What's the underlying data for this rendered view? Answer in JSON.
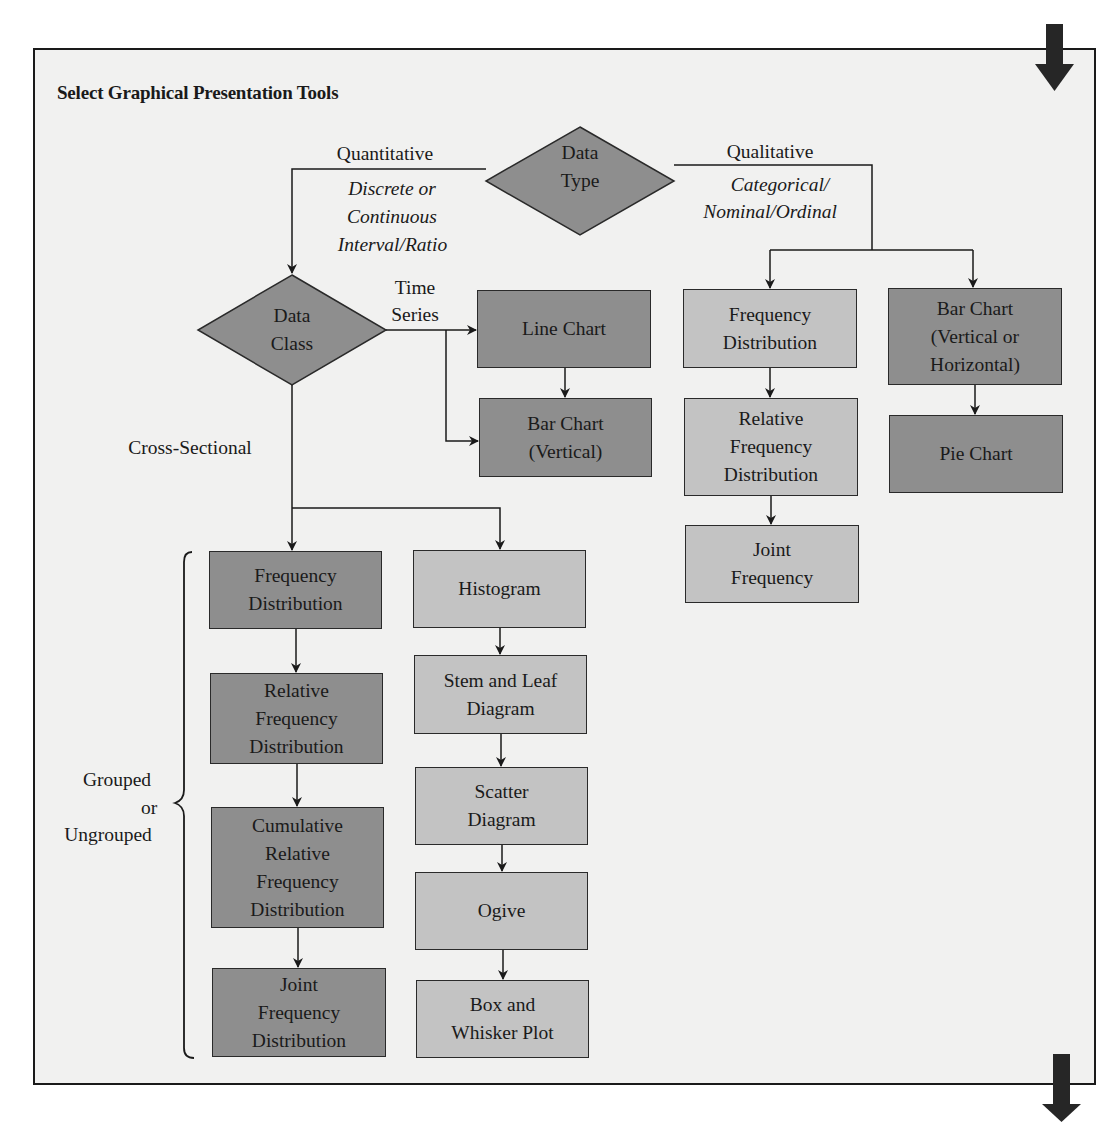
{
  "title": "Select Graphical Presentation Tools",
  "colors": {
    "frame_background": "#f1f1f0",
    "dark_box": "#8e8e8e",
    "light_box": "#c3c3c3",
    "diamond": "#8e8e8e",
    "lines": "#1a1a1a"
  },
  "decisions": {
    "data_type": "Data\nType",
    "data_class": "Data\nClass"
  },
  "branch_labels": {
    "quantitative": "Quantitative",
    "quantitative_desc_1": "Discrete or",
    "quantitative_desc_2": "Continuous",
    "quantitative_desc_3": "Interval/Ratio",
    "qualitative": "Qualitative",
    "qualitative_desc_1": "Categorical/",
    "qualitative_desc_2": "Nominal/Ordinal",
    "time_series_1": "Time",
    "time_series_2": "Series",
    "cross_sectional": "Cross-Sectional",
    "grouped_1": "Grouped",
    "grouped_2": "or",
    "grouped_3": "Ungrouped"
  },
  "time_series_tools": [
    {
      "label": "Line Chart",
      "shade": "dark"
    },
    {
      "label": "Bar Chart\n(Vertical)",
      "shade": "dark"
    }
  ],
  "qualitative_tools_left": [
    {
      "label": "Frequency\nDistribution",
      "shade": "light"
    },
    {
      "label": "Relative\nFrequency\nDistribution",
      "shade": "light"
    },
    {
      "label": "Joint\nFrequency",
      "shade": "light"
    }
  ],
  "qualitative_tools_right": [
    {
      "label": "Bar Chart\n(Vertical or\nHorizontal)",
      "shade": "dark"
    },
    {
      "label": "Pie Chart",
      "shade": "dark"
    }
  ],
  "cross_sectional_tables": [
    {
      "label": "Frequency\nDistribution",
      "shade": "dark"
    },
    {
      "label": "Relative\nFrequency\nDistribution",
      "shade": "dark"
    },
    {
      "label": "Cumulative\nRelative\nFrequency\nDistribution",
      "shade": "dark"
    },
    {
      "label": "Joint\nFrequency\nDistribution",
      "shade": "dark"
    }
  ],
  "cross_sectional_graphs": [
    {
      "label": "Histogram",
      "shade": "light"
    },
    {
      "label": "Stem and Leaf\nDiagram",
      "shade": "light"
    },
    {
      "label": "Scatter\nDiagram",
      "shade": "light"
    },
    {
      "label": "Ogive",
      "shade": "light"
    },
    {
      "label": "Box and\nWhisker Plot",
      "shade": "light"
    }
  ],
  "page_arrows": [
    "continue-top-arrow",
    "continue-bottom-arrow"
  ]
}
